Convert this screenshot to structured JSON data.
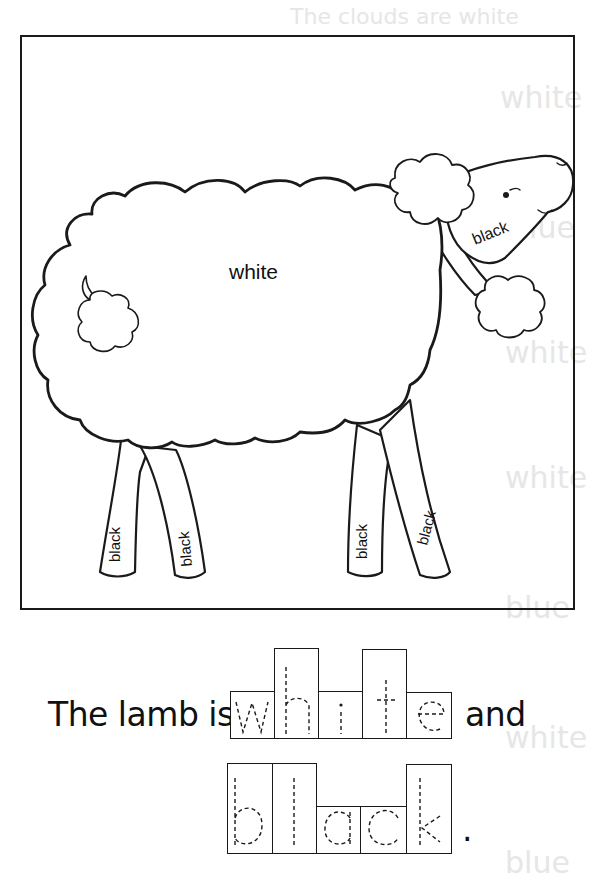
{
  "worksheet": {
    "bleed_through_text": {
      "top_line": "The clouds are white",
      "side_words": [
        "white",
        "blue",
        "white",
        "white",
        "blue",
        "white",
        "blue"
      ]
    },
    "picture": {
      "subject": "lamb",
      "labels": {
        "body": "white",
        "face": "black",
        "legs": [
          "black",
          "black",
          "black",
          "black"
        ]
      }
    },
    "sentence": {
      "prefix": "The lamb is",
      "conjunction": "and",
      "terminator": ".",
      "trace_word_1": {
        "word": "white",
        "letters": [
          "w",
          "h",
          "i",
          "t",
          "e"
        ],
        "box_heights": [
          "short",
          "tall",
          "short",
          "tall",
          "short"
        ]
      },
      "trace_word_2": {
        "word": "black",
        "letters": [
          "b",
          "l",
          "a",
          "c",
          "k"
        ],
        "box_heights": [
          "tall",
          "tall",
          "short",
          "short",
          "tall"
        ]
      }
    },
    "colors": {
      "ink": "#1a1a1a",
      "paper": "#ffffff",
      "bleed_through": "#e6e6e6"
    }
  }
}
